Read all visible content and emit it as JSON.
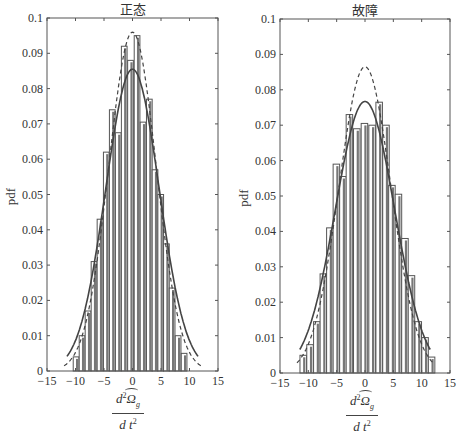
{
  "chart_data": [
    {
      "type": "bar",
      "title": "正态",
      "xlabel": "d²Ω̂_g / dt²",
      "ylabel": "pdf",
      "xlim": [
        -15,
        15
      ],
      "ylim": [
        0,
        0.1
      ],
      "xticks": [
        "−15",
        "−10",
        "−5",
        "0",
        "5",
        "10",
        "15"
      ],
      "yticks": [
        "0",
        "0.01",
        "0.02",
        "0.03",
        "0.04",
        "0.05",
        "0.06",
        "0.07",
        "0.08",
        "0.09",
        "0.1"
      ],
      "grid": false,
      "bar_width": 1.0,
      "x": [
        -9.9,
        -8.85,
        -7.8,
        -6.75,
        -5.7,
        -4.6,
        -3.55,
        -2.5,
        -1.45,
        -0.35,
        0.8,
        1.85,
        2.95,
        3.95,
        4.95,
        5.95,
        6.95,
        8.0,
        9.05
      ],
      "values": [
        0.004,
        0.01,
        0.017,
        0.031,
        0.043,
        0.062,
        0.074,
        0.0675,
        0.092,
        0.088,
        0.095,
        0.0705,
        0.077,
        0.057,
        0.05,
        0.036,
        0.0235,
        0.01,
        0.005
      ],
      "series": [
        {
          "name": "fitted pdf (solid)",
          "style": "solid",
          "peak": 0.0855,
          "mean": 0.0,
          "std": 4.67
        },
        {
          "name": "fitted pdf (dashed)",
          "style": "dashed",
          "peak": 0.096,
          "mean": 0.0,
          "std": 4.15
        }
      ]
    },
    {
      "type": "bar",
      "title": "故障",
      "xlabel": "d²Ω̂_g / dt²",
      "ylabel": "pdf",
      "xlim": [
        -15,
        15
      ],
      "ylim": [
        0,
        0.1
      ],
      "xticks": [
        "−15",
        "−10",
        "−5",
        "0",
        "5",
        "10",
        "15"
      ],
      "yticks": [
        "0",
        "0.01",
        "0.02",
        "0.03",
        "0.04",
        "0.05",
        "0.06",
        "0.07",
        "0.08",
        "0.09",
        "0.1"
      ],
      "grid": false,
      "bar_width": 1.15,
      "x": [
        -10.9,
        -9.7,
        -8.5,
        -7.35,
        -6.2,
        -5.05,
        -3.9,
        -2.75,
        -1.45,
        -0.1,
        1.25,
        2.5,
        3.7,
        4.75,
        5.9,
        7.05,
        8.2,
        9.4,
        10.6,
        11.75
      ],
      "values": [
        0.005,
        0.008,
        0.0145,
        0.028,
        0.041,
        0.059,
        0.0555,
        0.073,
        0.069,
        0.0705,
        0.07,
        0.0765,
        0.07,
        0.053,
        0.0505,
        0.038,
        0.0275,
        0.0145,
        0.01,
        0.0045
      ],
      "series": [
        {
          "name": "fitted pdf (solid)",
          "style": "solid",
          "peak": 0.0767,
          "mean": 0.0,
          "std": 5.2
        },
        {
          "name": "fitted pdf (dashed)",
          "style": "dashed",
          "peak": 0.0865,
          "mean": 0.0,
          "std": 4.6
        }
      ]
    }
  ],
  "charts": [
    {
      "title": "正态",
      "ylabel": "pdf",
      "xlabel_num_d": "d",
      "xlabel_num_sup": "2",
      "xlabel_num_omega": "Ω",
      "xlabel_num_sub": "g",
      "xlabel_den_d": "d",
      "xlabel_den_t": "t",
      "xlabel_den_sup": "2"
    },
    {
      "title": "故障",
      "ylabel": "pdf",
      "xlabel_num_d": "d",
      "xlabel_num_sup": "2",
      "xlabel_num_omega": "Ω",
      "xlabel_num_sub": "g",
      "xlabel_den_d": "d",
      "xlabel_den_t": "t",
      "xlabel_den_sup": "2"
    }
  ],
  "colors": {
    "bar_fill": "#ffffff",
    "bar_edge": "#555555",
    "curve": "#444444",
    "axis": "#555555"
  }
}
